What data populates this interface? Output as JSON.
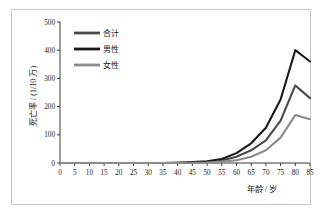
{
  "chart_data": {
    "type": "line",
    "title": "",
    "xlabel": "年龄 / 岁",
    "ylabel": "死亡率 / (1/10 万)",
    "xlim": [
      0,
      85
    ],
    "ylim": [
      0,
      500
    ],
    "xticks": [
      "0",
      "5",
      "10",
      "15",
      "20",
      "25",
      "30",
      "35",
      "40",
      "45",
      "50",
      "55",
      "60",
      "65",
      "70",
      "75",
      "80",
      "85"
    ],
    "yticks": [
      "0",
      "100",
      "200",
      "300",
      "400",
      "500"
    ],
    "grid": false,
    "legend_position": "top-left",
    "x": [
      0,
      5,
      10,
      15,
      20,
      25,
      30,
      35,
      40,
      45,
      50,
      55,
      60,
      65,
      70,
      75,
      80,
      85
    ],
    "series": [
      {
        "name": "合计",
        "color": "#4a4a4a",
        "values": [
          0,
          0,
          0,
          0,
          0,
          0,
          0,
          0,
          1,
          2,
          4,
          9,
          22,
          45,
          80,
          150,
          275,
          230
        ]
      },
      {
        "name": "男性",
        "color": "#1a1a1a",
        "values": [
          0,
          0,
          0,
          0,
          0,
          0,
          0,
          0,
          1,
          3,
          6,
          14,
          35,
          70,
          125,
          225,
          400,
          360
        ]
      },
      {
        "name": "女性",
        "color": "#8c8c8c",
        "values": [
          0,
          0,
          0,
          0,
          0,
          0,
          0,
          0,
          0,
          1,
          2,
          5,
          10,
          22,
          45,
          90,
          170,
          155
        ]
      }
    ]
  },
  "legend": {
    "items": [
      {
        "label": "合计",
        "color": "#4a4a4a"
      },
      {
        "label": "男性",
        "color": "#1a1a1a"
      },
      {
        "label": "女性",
        "color": "#8c8c8c"
      }
    ]
  },
  "axes": {
    "y_title": "死亡率 / (1/10 万)",
    "x_title": "年龄 / 岁"
  }
}
